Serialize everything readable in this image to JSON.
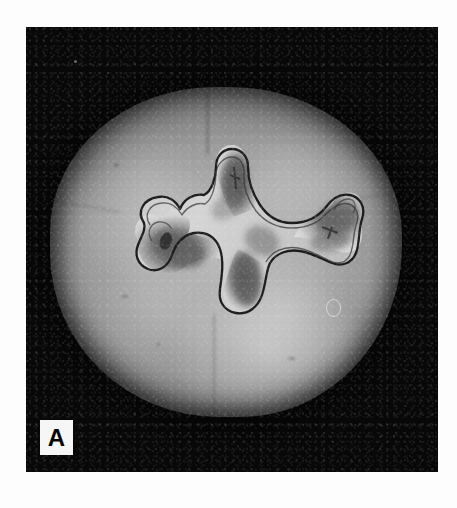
{
  "figure": {
    "panel_letter": "A",
    "caption_visible": false,
    "modality": "grayscale-photomicrograph",
    "background_color": "#080808",
    "page_color": "#ffffff",
    "plate": {
      "x": 26,
      "y": 27,
      "width": 412,
      "height": 445
    },
    "specimen": {
      "name": "molar-crown",
      "enamel_tone": "#b9b9b9",
      "dentin_tone": "#989898",
      "outline_shape": "rounded-quadrilateral-with-four-cusp-lobes",
      "lobes": [
        "mesiobuccal",
        "distobuccal",
        "mesiolingual",
        "distolingual"
      ]
    },
    "pulp_chamber": {
      "name": "pulp-chamber",
      "outline_color": "#1a1a1a",
      "interior_highlight": "#cfcfcf",
      "horn_count": 4,
      "horns": [
        "mesiobuccal-pulp-horn",
        "distobuccal-pulp-horn",
        "mesiolingual-pulp-horn",
        "distolingual-pulp-horn"
      ],
      "orientation": "z-shaped, running mesial-buccal to distal-lingual"
    },
    "artifacts": [
      {
        "name": "dust-speck",
        "x": 74,
        "y": 60
      },
      {
        "name": "bubble-artifact",
        "x": 326,
        "y": 299
      }
    ]
  }
}
